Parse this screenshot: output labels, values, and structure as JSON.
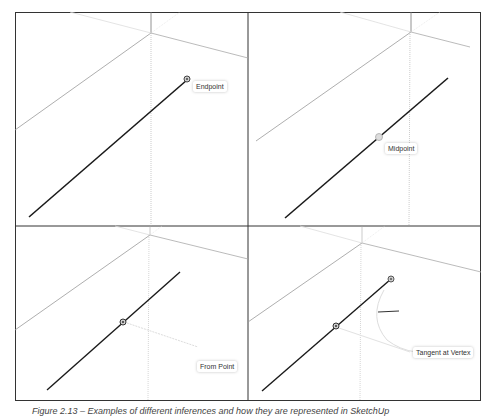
{
  "figure": {
    "panels": [
      {
        "id": "top-left",
        "label": "Endpoint"
      },
      {
        "id": "top-right",
        "label": "Midpoint"
      },
      {
        "id": "bottom-left",
        "label": "From Point"
      },
      {
        "id": "bottom-right",
        "label": "Tangent at Vertex"
      }
    ],
    "caption": "Figure 2.13 – Examples of different inferences and how they are represented in SketchUp"
  },
  "colors": {
    "frame": "#333333",
    "edge": "#1a1a1a",
    "axis": "#999999",
    "axis_light": "#cccccc"
  }
}
